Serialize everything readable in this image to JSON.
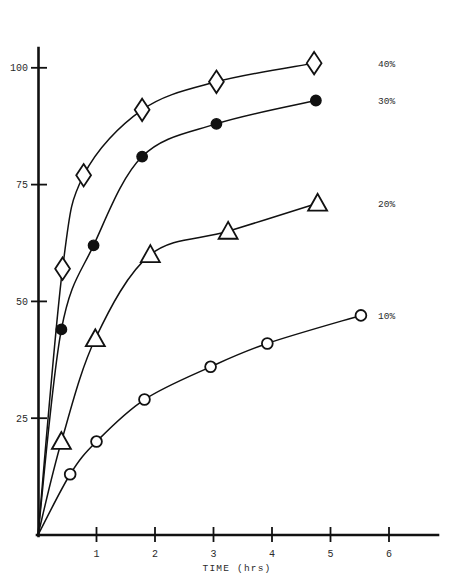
{
  "chart_data": {
    "type": "line",
    "title": "",
    "xlabel": "TIME (hrs)",
    "ylabel": "",
    "xlim": [
      0,
      6.6
    ],
    "ylim": [
      0,
      108
    ],
    "grid": false,
    "legend_position": "right-of-plot",
    "x_ticks": [
      "1",
      "2",
      "3",
      "4",
      "5",
      "6"
    ],
    "x_tick_values": [
      1,
      2,
      3,
      4,
      5,
      6
    ],
    "y_ticks": [
      "25",
      "50",
      "75",
      "100"
    ],
    "y_tick_values": [
      25,
      50,
      75,
      100
    ],
    "series": [
      {
        "name": "40%",
        "marker": "diamond-open",
        "label": "40%",
        "points": [
          {
            "x": 0.0,
            "y": 0
          },
          {
            "x": 0.42,
            "y": 57
          },
          {
            "x": 0.78,
            "y": 77
          },
          {
            "x": 1.78,
            "y": 91
          },
          {
            "x": 3.05,
            "y": 97
          },
          {
            "x": 4.72,
            "y": 101
          }
        ]
      },
      {
        "name": "30%",
        "marker": "circle-filled",
        "label": "30%",
        "points": [
          {
            "x": 0.0,
            "y": 0
          },
          {
            "x": 0.4,
            "y": 44
          },
          {
            "x": 0.95,
            "y": 62
          },
          {
            "x": 1.78,
            "y": 81
          },
          {
            "x": 3.05,
            "y": 88
          },
          {
            "x": 4.75,
            "y": 93
          }
        ]
      },
      {
        "name": "20%",
        "marker": "triangle-open",
        "label": "20%",
        "points": [
          {
            "x": 0.0,
            "y": 0
          },
          {
            "x": 0.4,
            "y": 20
          },
          {
            "x": 0.98,
            "y": 42
          },
          {
            "x": 1.92,
            "y": 60
          },
          {
            "x": 3.25,
            "y": 65
          },
          {
            "x": 4.78,
            "y": 71
          }
        ]
      },
      {
        "name": "10%",
        "marker": "circle-open",
        "label": "10%",
        "points": [
          {
            "x": 0.0,
            "y": 0
          },
          {
            "x": 0.55,
            "y": 13
          },
          {
            "x": 1.0,
            "y": 20
          },
          {
            "x": 1.82,
            "y": 29
          },
          {
            "x": 2.95,
            "y": 36
          },
          {
            "x": 3.92,
            "y": 41
          },
          {
            "x": 5.52,
            "y": 47
          }
        ]
      }
    ]
  },
  "axes": {
    "x_axis_name": "time-axis",
    "y_axis_name": "value-axis",
    "x_title": "TIME (hrs)"
  },
  "legend": {
    "items": [
      {
        "label": "40%"
      },
      {
        "label": "30%"
      },
      {
        "label": "20%"
      },
      {
        "label": "10%"
      }
    ]
  },
  "style": {
    "stroke": "#111111",
    "background": "#ffffff",
    "marker_fill_open": "#ffffff",
    "marker_fill_solid": "#111111"
  }
}
